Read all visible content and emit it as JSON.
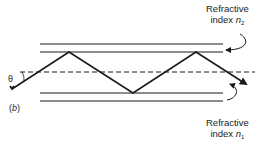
{
  "figure": {
    "part_label_open": "(",
    "part_label_letter": "b",
    "part_label_close": ")",
    "angle_symbol": "θ",
    "top_label": {
      "line1": "Refractive",
      "line2_prefix": "index ",
      "symbol": "n",
      "subscript": "2"
    },
    "bottom_label": {
      "line1": "Refractive",
      "line2_prefix": "index ",
      "symbol": "n",
      "subscript": "1"
    }
  },
  "colors": {
    "line": "#1a1a1a",
    "background": "#ffffff"
  }
}
